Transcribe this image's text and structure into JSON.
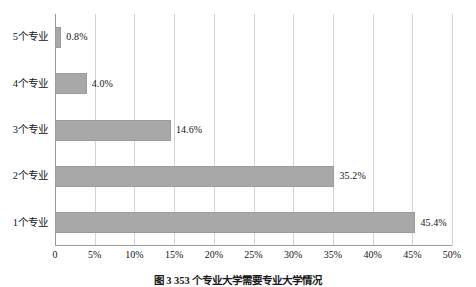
{
  "chart_data": {
    "type": "bar",
    "orientation": "horizontal",
    "title": "",
    "xlabel": "",
    "ylabel": "",
    "categories": [
      "1个专业",
      "2个专业",
      "3个专业",
      "4个专业",
      "5个专业"
    ],
    "values": [
      45.4,
      35.2,
      14.6,
      4.0,
      0.8
    ],
    "data_labels": [
      "45.4%",
      "35.2%",
      "14.6%",
      "4.0%",
      "0.8%"
    ],
    "xlim": [
      0,
      50
    ],
    "xticks": [
      0,
      5,
      10,
      15,
      20,
      25,
      30,
      35,
      40,
      45,
      50
    ],
    "xtick_labels": [
      "0",
      "5%",
      "10%",
      "15%",
      "20%",
      "25%",
      "30%",
      "35%",
      "40%",
      "45%",
      "50%"
    ],
    "grid": "vertical",
    "legend": "none",
    "bar_color": "#a8a8a8",
    "bar_border_color": "#9c9c9c",
    "gridline_color": "#d4d4d4",
    "axis_color": "#9a9a9a",
    "background": "#ffffff"
  },
  "caption": {
    "text": "图 3  353 个专业大学需要专业大学情况"
  }
}
